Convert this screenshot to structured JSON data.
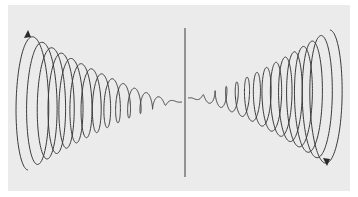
{
  "figure": {
    "colors": {
      "background": "#ebebeb",
      "stroke": "#3a3a3a"
    },
    "axis": {
      "x": 185,
      "y_top": 28,
      "y_bottom": 177
    },
    "left_spiral": {
      "turns": 14,
      "x_outer": 28,
      "x_apex": 182,
      "radius_y_outer": 68,
      "radius_x_outer": 14,
      "center_y": 102,
      "arrow": "up"
    },
    "right_spiral": {
      "turns": 14,
      "x_outer": 330,
      "x_apex": 188,
      "radius_y_outer": 68,
      "radius_x_outer": 14,
      "center_y": 98,
      "arrow": "down"
    }
  }
}
